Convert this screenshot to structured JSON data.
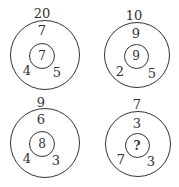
{
  "puzzle": {
    "figures": [
      {
        "top": "20",
        "upper": "7",
        "left": "4",
        "right": "5",
        "center": "7"
      },
      {
        "top": "10",
        "upper": "9",
        "left": "2",
        "right": "5",
        "center": "9"
      },
      {
        "top": "9",
        "upper": "6",
        "left": "4",
        "right": "3",
        "center": "8"
      },
      {
        "top": "7",
        "upper": "3",
        "left": "7",
        "right": "3",
        "center": "?"
      }
    ]
  }
}
